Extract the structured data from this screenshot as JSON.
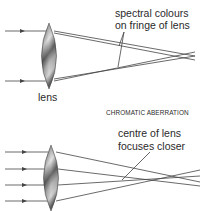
{
  "diagram": {
    "top": {
      "annotation_line1": "spectral colours",
      "annotation_line2": "on fringe of lens",
      "lens_label": "lens"
    },
    "caption": "CHROMATIC ABERRATION",
    "bottom": {
      "annotation_line1": "centre of lens",
      "annotation_line2": "focuses closer"
    },
    "colors": {
      "line": "#444444",
      "text": "#2a2a2a",
      "lens_dark": "#555555",
      "lens_light": "#e8e8e8"
    }
  }
}
